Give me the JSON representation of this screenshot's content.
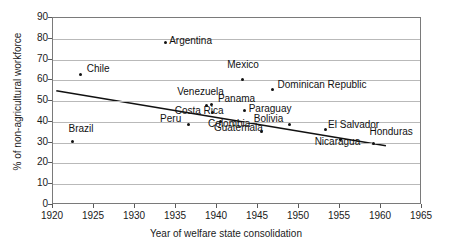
{
  "chart_data": {
    "type": "scatter",
    "title": "",
    "xlabel": "Year of welfare state consolidation",
    "ylabel": "% of non-agricultural workforce",
    "xlim": [
      1920,
      1965
    ],
    "ylim": [
      0,
      90
    ],
    "xticks": [
      1920,
      1925,
      1930,
      1935,
      1940,
      1945,
      1950,
      1955,
      1960,
      1965
    ],
    "yticks": [
      0,
      10,
      20,
      30,
      40,
      50,
      60,
      70,
      80,
      90
    ],
    "grid": true,
    "legend": "none",
    "points": [
      {
        "label": "Brazil",
        "x": 1922.5,
        "y": 30.0,
        "label_dx": -4,
        "label_dy": -13,
        "label_align": "left"
      },
      {
        "label": "Chile",
        "x": 1923.5,
        "y": 62.5,
        "label_dx": 6,
        "label_dy": -5,
        "label_align": "left"
      },
      {
        "label": "Argentina",
        "x": 1933.8,
        "y": 77.5,
        "label_dx": 4,
        "label_dy": -2,
        "label_align": "left"
      },
      {
        "label": "Peru",
        "x": 1936.6,
        "y": 38.5,
        "label_dx": -28,
        "label_dy": -5,
        "label_align": "left"
      },
      {
        "label": "Venezuela",
        "x": 1938.8,
        "y": 47.5,
        "label_dx": -29,
        "label_dy": -13,
        "label_align": "left"
      },
      {
        "label": "Panama",
        "x": 1939.5,
        "y": 48.0,
        "label_dx": 6,
        "label_dy": -5,
        "label_align": "left"
      },
      {
        "label": "Costa Rica",
        "x": 1939.6,
        "y": 44.0,
        "label_dx": -38,
        "label_dy": -2,
        "label_align": "left"
      },
      {
        "label": "Colombia",
        "x": 1940.5,
        "y": 39.5,
        "label_dx": -12,
        "label_dy": 2,
        "label_align": "left"
      },
      {
        "label": "Mexico",
        "x": 1943.2,
        "y": 60.0,
        "label_dx": -15,
        "label_dy": -14,
        "label_align": "left"
      },
      {
        "label": "Paraguay",
        "x": 1943.5,
        "y": 45.0,
        "label_dx": 4,
        "label_dy": -2,
        "label_align": "left"
      },
      {
        "label": "Guatemala",
        "x": 1945.6,
        "y": 35.0,
        "label_dx": -48,
        "label_dy": -3,
        "label_align": "left"
      },
      {
        "label": "Dominican Republic",
        "x": 1946.9,
        "y": 55.0,
        "label_dx": 5,
        "label_dy": -5,
        "label_align": "left"
      },
      {
        "label": "Bolivia",
        "x": 1949.0,
        "y": 38.5,
        "label_dx": -36,
        "label_dy": -5,
        "label_align": "left"
      },
      {
        "label": "El Salvador",
        "x": 1953.3,
        "y": 36.0,
        "label_dx": 3,
        "label_dy": -4,
        "label_align": "left"
      },
      {
        "label": "Nicaragua",
        "x": 1955.2,
        "y": 31.0,
        "label_dx": -26,
        "label_dy": 2,
        "label_align": "left"
      },
      {
        "label": "Honduras",
        "x": 1959.2,
        "y": 29.0,
        "label_dx": -4,
        "label_dy": -12,
        "label_align": "left"
      }
    ],
    "trendline": {
      "x1": 1920.4,
      "y1": 55.0,
      "x2": 1960.6,
      "y2": 28.5
    }
  }
}
